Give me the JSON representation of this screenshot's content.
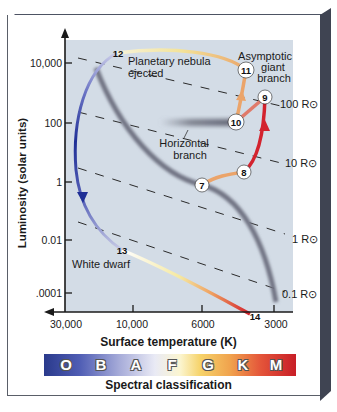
{
  "diagram": {
    "y_axis": {
      "label": "Luminosity (solar units)",
      "ticks": [
        "10,000",
        "100",
        "1",
        "0.01",
        ".0001"
      ]
    },
    "x_axis": {
      "label": "Surface temperature (K)",
      "ticks": [
        "30,000",
        "10,000",
        "6000",
        "3000"
      ]
    },
    "radius_lines": [
      "100 R⊙",
      "10 R⊙",
      "1 R⊙",
      "0.1 R⊙"
    ],
    "annotations": {
      "planetary_nebula_line1": "Planetary nebula",
      "planetary_nebula_line2": "ejected",
      "agb_line1": "Asymptotic",
      "agb_line2": "giant",
      "agb_line3": "branch",
      "horizontal_line1": "Horizontal",
      "horizontal_line2": "branch",
      "white_dwarf": "White dwarf"
    },
    "stages": [
      {
        "id": "7",
        "label": "7"
      },
      {
        "id": "8",
        "label": "8"
      },
      {
        "id": "9",
        "label": "9"
      },
      {
        "id": "10",
        "label": "10"
      },
      {
        "id": "11",
        "label": "11"
      },
      {
        "id": "12",
        "label": "12"
      },
      {
        "id": "13",
        "label": "13"
      },
      {
        "id": "14",
        "label": "14"
      }
    ],
    "spectral": {
      "caption": "Spectral classification",
      "classes": [
        "O",
        "B",
        "A",
        "F",
        "G",
        "K",
        "M"
      ]
    },
    "colors": {
      "plot_bg": "#d3dce6",
      "main_sequence": "#7c7f8c",
      "blue_track": "#2b3a9a",
      "red_track": "#d3232e",
      "orange_track": "#e9a06a",
      "frame_dark": "#4a5060"
    }
  }
}
